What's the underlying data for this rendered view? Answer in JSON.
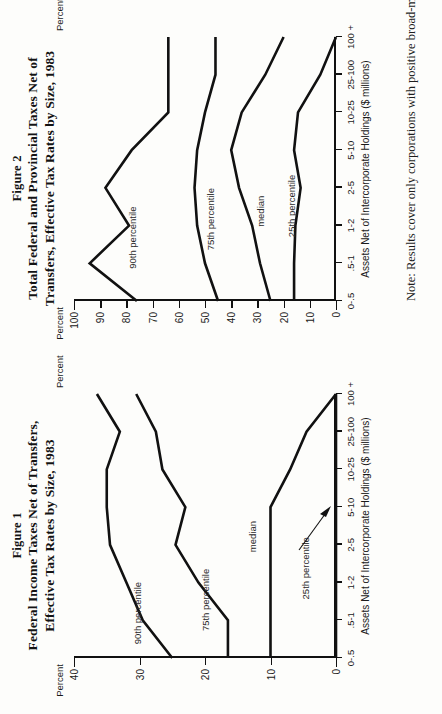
{
  "page": {
    "orientation": "rotated-90-ccw",
    "note": "Note:  Results cover only corporations with positive broad-mark income"
  },
  "figure1": {
    "fignum": "Figure 1",
    "title_line1": "Federal Income Taxes Net of Transfers,",
    "title_line2": "Effective Tax Rates by Size, 1983",
    "percent_label_left": "Percent",
    "percent_label_right": "Percent",
    "xaxis_caption": "Assets Net of Intercorporate Holdings ($ millions)",
    "series_labels": {
      "p90": "90th percentile",
      "p75": "75th percentile",
      "median": "median",
      "p25": "25th percentile"
    }
  },
  "figure2": {
    "fignum": "Figure 2",
    "title_line1": "Total Federal and Provincial Taxes Net of",
    "title_line2": "Transfers, Effective Tax Rates by Size, 1983",
    "percent_label_left": "Percent",
    "percent_label_right": "Percent",
    "xaxis_caption": "Assets Net of Intercorporate Holdings ($ millions)",
    "series_labels": {
      "p90": "90th percentile",
      "p75": "75th percentile",
      "median": "median",
      "p25": "25th percentile"
    }
  },
  "chart_data": [
    {
      "type": "line",
      "id": "figure-1",
      "title": "Figure 1 — Federal Income Taxes Net of Transfers, Effective Tax Rates by Size, 1983",
      "xlabel": "Assets Net of Intercorporate Holdings ($ millions)",
      "ylabel": "Percent",
      "categories": [
        "0-.5",
        ".5-1",
        "1-2",
        "2-5",
        "5-10",
        "10-25",
        "25-100",
        "100 +"
      ],
      "ylim": [
        0,
        40
      ],
      "yticks": [
        0,
        10,
        20,
        30,
        40
      ],
      "ytick_labels": [
        "0",
        "10",
        "20",
        "30",
        "40"
      ],
      "grid": false,
      "legend": "inline-labels",
      "series": [
        {
          "name": "90th percentile",
          "values": [
            25.0,
            29.5,
            32.0,
            34.5,
            35.0,
            35.0,
            33.0,
            36.5
          ]
        },
        {
          "name": "75th percentile",
          "values": [
            16.5,
            16.5,
            21.0,
            24.5,
            23.0,
            26.5,
            27.5,
            30.5
          ]
        },
        {
          "name": "median",
          "values": [
            10.0,
            10.0,
            10.0,
            10.0,
            10.0,
            7.0,
            4.5,
            0.0
          ]
        },
        {
          "name": "25th percentile",
          "values": [
            0.0,
            0.0,
            0.0,
            0.0,
            0.0,
            0.0,
            0.0,
            0.0
          ]
        }
      ],
      "annotations": [
        {
          "text": "25th percentile",
          "points_to": "flat zero line near 5-10"
        }
      ]
    },
    {
      "type": "line",
      "id": "figure-2",
      "title": "Figure 2 — Total Federal and Provincial Taxes Net of Transfers, Effective Tax Rates by Size, 1983",
      "xlabel": "Assets Net of Intercorporate Holdings ($ millions)",
      "ylabel": "Percent",
      "categories": [
        "0-.5",
        ".5-1",
        "1-2",
        "2-5",
        "5-10",
        "10-25",
        "25-100",
        "100 +"
      ],
      "ylim": [
        0,
        100
      ],
      "yticks": [
        0,
        10,
        20,
        30,
        40,
        50,
        60,
        70,
        80,
        90,
        100
      ],
      "ytick_labels": [
        "0",
        "10",
        "20",
        "30",
        "40",
        "50",
        "60",
        "70",
        "80",
        "90",
        "100"
      ],
      "grid": false,
      "legend": "inline-labels",
      "series": [
        {
          "name": "90th percentile",
          "values": [
            76.0,
            94.0,
            79.0,
            88.0,
            78.0,
            64.0,
            64.0,
            64.0
          ]
        },
        {
          "name": "75th percentile",
          "values": [
            45.0,
            50.0,
            53.0,
            54.0,
            53.0,
            50.0,
            46.0,
            46.0
          ]
        },
        {
          "name": "median",
          "values": [
            25.0,
            29.0,
            32.0,
            37.0,
            40.0,
            36.0,
            27.0,
            20.0
          ]
        },
        {
          "name": "25th percentile",
          "values": [
            16.0,
            16.0,
            15.5,
            13.5,
            16.0,
            14.5,
            6.0,
            0.0
          ]
        }
      ]
    }
  ]
}
